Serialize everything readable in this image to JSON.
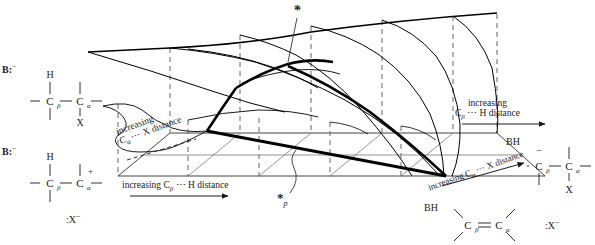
{
  "figure": {
    "type": "reaction-energy-surface",
    "surface_color": "#000000",
    "grid_color": "#555555"
  },
  "axes": {
    "bottom": {
      "text": "increasing Cβ ⋯ H distance",
      "prefix": "increasing C",
      "sub": "β",
      "suffix": " ⋯ H distance",
      "has_arrow": true
    },
    "left_diagonal": {
      "line1": "increasing",
      "line2_prefix": "C",
      "line2_sub": "α",
      "line2_suffix": " ⋯ X distance"
    },
    "right_vertical": {
      "line1": "increasing",
      "line2_prefix": "C",
      "line2_sub": "β",
      "line2_suffix": " ⋯ H distance",
      "has_arrow": true
    },
    "right_diagonal": {
      "prefix": "increasing C",
      "sub": "α",
      "suffix": " ⋯ X distance",
      "has_arrow": true
    }
  },
  "markers": {
    "saddle_star": "*",
    "saddle_star_projection": "*",
    "saddle_star_projection_sub": "p"
  },
  "species": {
    "top_left": {
      "base": "B:",
      "base_charge": "−",
      "atom_top": "H",
      "atom_left": "C",
      "atom_left_sub": "β",
      "atom_right": "C",
      "atom_right_sub": "α",
      "leaving_group": "X",
      "name": "reactant-substrate-with-base"
    },
    "bottom_left": {
      "base": "B:",
      "base_charge": "−",
      "atom_top": "H",
      "atom_left": "C",
      "atom_left_sub": "β",
      "atom_right": "C",
      "atom_right_sub": "α",
      "atom_right_charge": "+",
      "leaving_group": ":X",
      "leaving_group_charge": "−",
      "name": "carbocation-intermediate-E1"
    },
    "top_right": {
      "base": "BH",
      "atom_left": "C",
      "atom_left_sub": "β",
      "atom_left_charge": "−",
      "atom_right": "C",
      "atom_right_sub": "α",
      "leaving_group": "X",
      "name": "carbanion-intermediate-E1cb"
    },
    "bottom_right": {
      "base": "BH",
      "atom_left": "C",
      "atom_left_sub": "β",
      "atom_right": "C",
      "atom_right_sub": "α",
      "bond": "double",
      "leaving_group": ":X",
      "leaving_group_charge": "−",
      "name": "alkene-product"
    }
  }
}
